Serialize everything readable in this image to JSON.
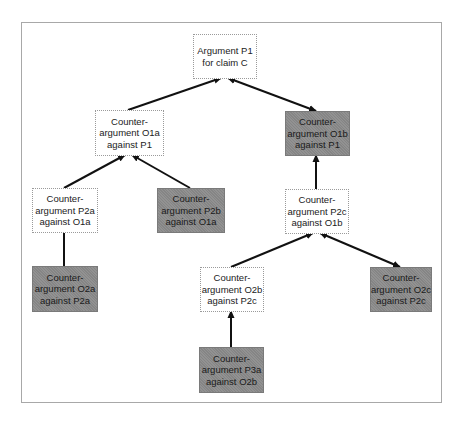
{
  "diagram": {
    "title": "",
    "colors": {
      "supporting_node_fill": "#ffffff",
      "opposing_node_fill": "#8c8c8c",
      "edge": "#111111",
      "frame": "#a8a8a8"
    },
    "nodes": [
      {
        "id": "P1",
        "style": "pro",
        "lines": [
          "Argument P1",
          "for claim C"
        ]
      },
      {
        "id": "O1a",
        "style": "pro",
        "lines": [
          "Counter-",
          "argument O1a",
          "against P1"
        ]
      },
      {
        "id": "O1b",
        "style": "con",
        "lines": [
          "Counter-",
          "argument O1b",
          "against P1"
        ]
      },
      {
        "id": "P2a",
        "style": "pro",
        "lines": [
          "Counter-",
          "argument P2a",
          "against O1a"
        ]
      },
      {
        "id": "P2b",
        "style": "con",
        "lines": [
          "Counter-",
          "argument P2b",
          "against O1a"
        ]
      },
      {
        "id": "P2c",
        "style": "pro",
        "lines": [
          "Counter-",
          "argument P2c",
          "against O1b"
        ]
      },
      {
        "id": "O2a",
        "style": "con",
        "lines": [
          "Counter-",
          "argument O2a",
          "against P2a"
        ]
      },
      {
        "id": "O2b",
        "style": "pro",
        "lines": [
          "Counter-",
          "argument O2b",
          "against P2c"
        ]
      },
      {
        "id": "O2c",
        "style": "con",
        "lines": [
          "Counter-",
          "argument O2c",
          "against P2c"
        ]
      },
      {
        "id": "P3a",
        "style": "con",
        "lines": [
          "Counter-",
          "argument P3a",
          "against O2b"
        ]
      }
    ],
    "edges": [
      {
        "from": "O1a",
        "to": "P1",
        "type": "arrow"
      },
      {
        "from": "O1b",
        "to": "P1",
        "type": "double-arrow"
      },
      {
        "from": "P2a",
        "to": "O1a",
        "type": "arrow"
      },
      {
        "from": "P2b",
        "to": "O1a",
        "type": "arrow"
      },
      {
        "from": "O2a",
        "to": "P2a",
        "type": "line"
      },
      {
        "from": "P2c",
        "to": "O1b",
        "type": "arrow"
      },
      {
        "from": "O2b",
        "to": "P2c",
        "type": "arrow"
      },
      {
        "from": "O2c",
        "to": "P2c",
        "type": "double-arrow"
      },
      {
        "from": "P3a",
        "to": "O2b",
        "type": "arrow"
      }
    ]
  }
}
